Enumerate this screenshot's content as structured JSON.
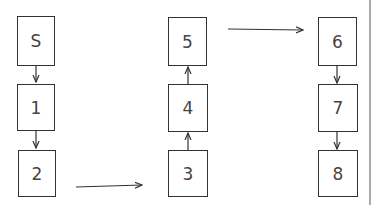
{
  "diagram": {
    "nodes": [
      {
        "id": "S",
        "label": "S"
      },
      {
        "id": "1",
        "label": "1"
      },
      {
        "id": "2",
        "label": "2"
      },
      {
        "id": "3",
        "label": "3"
      },
      {
        "id": "4",
        "label": "4"
      },
      {
        "id": "5",
        "label": "5"
      },
      {
        "id": "6",
        "label": "6"
      },
      {
        "id": "7",
        "label": "7"
      },
      {
        "id": "8",
        "label": "8"
      }
    ],
    "edges": [
      [
        "S",
        "1"
      ],
      [
        "1",
        "2"
      ],
      [
        "2",
        "3"
      ],
      [
        "3",
        "4"
      ],
      [
        "4",
        "5"
      ],
      [
        "5",
        "6"
      ],
      [
        "6",
        "7"
      ],
      [
        "7",
        "8"
      ]
    ],
    "colors": {
      "stroke": "#333333",
      "text": "#444444",
      "divider": "#aaaaaa"
    }
  }
}
